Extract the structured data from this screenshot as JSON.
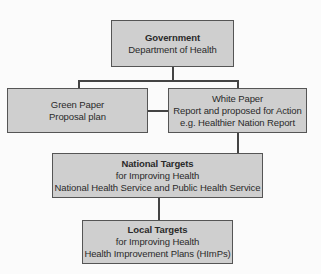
{
  "diagram": {
    "type": "hierarchy-flowchart",
    "nodes": [
      {
        "id": "government",
        "title": "Government",
        "lines": [
          "Department of Health"
        ]
      },
      {
        "id": "green-paper",
        "title": "",
        "lines": [
          "Green Paper",
          "Proposal plan"
        ]
      },
      {
        "id": "white-paper",
        "title": "",
        "lines": [
          "White Paper",
          "Report and proposed for Action",
          "e.g. Healthier Nation Report"
        ]
      },
      {
        "id": "national-targets",
        "title": "National Targets",
        "lines": [
          "for Improving Health",
          "National Health Service and Public Health Service"
        ]
      },
      {
        "id": "local-targets",
        "title": "Local Targets",
        "lines": [
          "for Improving Health",
          "Health Improvement Plans (HImPs)"
        ]
      }
    ],
    "edges": [
      {
        "from": "government",
        "to": "green-paper"
      },
      {
        "from": "government",
        "to": "white-paper"
      },
      {
        "from": "green-paper",
        "to": "white-paper"
      },
      {
        "from": "white-paper",
        "to": "national-targets"
      },
      {
        "from": "national-targets",
        "to": "local-targets"
      }
    ]
  },
  "colors": {
    "box_fill": "#cfcfcf",
    "box_border": "#555555",
    "connector": "#444444",
    "background": "#fbfbfb"
  }
}
